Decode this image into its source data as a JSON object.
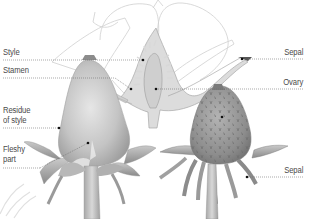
{
  "diagram": {
    "labels": {
      "style": "Style",
      "stamen": "Stamen",
      "residue_of_style": "Residue\nof style",
      "fleshy_part": "Fleshy\npart",
      "sepal_top": "Sepal",
      "ovary": "Ovary",
      "sepal_bottom": "Sepal"
    },
    "colors": {
      "label_text": "#4a4a4a",
      "leader_line": "#6e6e6e",
      "outline": "#c8c8c8",
      "fruit_fill": "#b9b9b9",
      "ripe_fruit_fill": "#8f8f8f",
      "dot": "#111111"
    }
  }
}
